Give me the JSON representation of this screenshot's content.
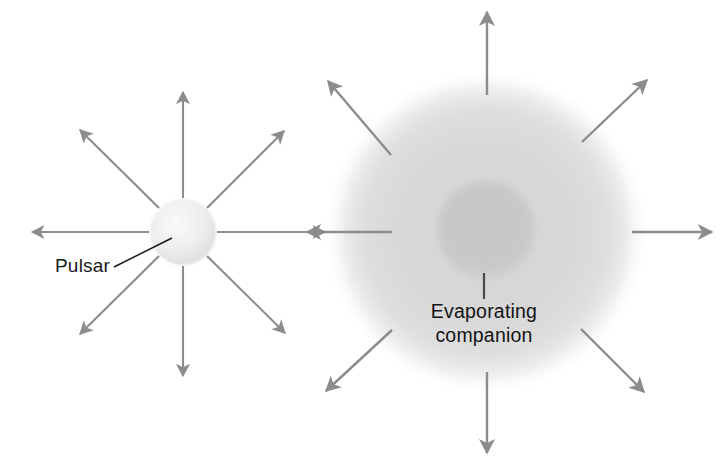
{
  "figure": {
    "background_color": "#ffffff"
  },
  "labels": {
    "pulsar": {
      "text": "Pulsar",
      "x": 55,
      "y": 272
    },
    "companion_line1": {
      "text": "Evaporating",
      "x": 484,
      "y": 318
    },
    "companion_line2": {
      "text": "companion",
      "x": 484,
      "y": 342
    }
  },
  "objects": {
    "pulsar_sphere": {
      "name": "Pulsar",
      "cx": 183,
      "cy": 232,
      "r": 33,
      "fill_light": "#f2f2f2",
      "fill_dark": "#d8d8d8"
    },
    "wind_cloud": {
      "name": "Evaporated gas cloud",
      "cx": 486,
      "cy": 232,
      "r": 156,
      "fill": "#d9d9d9"
    },
    "companion_core": {
      "name": "Evaporating companion",
      "cx": 486,
      "cy": 230,
      "r": 49,
      "fill": "#c9c9c9"
    }
  },
  "colors": {
    "arrow_stroke": "#8c8c8c",
    "leader_stroke": "#1a1a1a",
    "companion_leader_stroke": "#4a4a4a",
    "text": "#1a1a1a",
    "cloud": "#d9d9d9",
    "core": "#c9c9c9",
    "sphere": "#ededed"
  },
  "pulsar_arrows": {
    "count": 8,
    "description": "Eight arrows radiating outward from the pulsar",
    "items": [
      {
        "dir": "north",
        "x1": 183,
        "y1": 198,
        "x2": 183,
        "y2": 92
      },
      {
        "dir": "northeast",
        "x1": 207,
        "y1": 208,
        "x2": 284,
        "y2": 131
      },
      {
        "dir": "east",
        "x1": 217,
        "y1": 232,
        "x2": 325,
        "y2": 232
      },
      {
        "dir": "southeast",
        "x1": 207,
        "y1": 256,
        "x2": 285,
        "y2": 333
      },
      {
        "dir": "south",
        "x1": 183,
        "y1": 266,
        "x2": 183,
        "y2": 376
      },
      {
        "dir": "southwest",
        "x1": 159,
        "y1": 256,
        "x2": 80,
        "y2": 334
      },
      {
        "dir": "west",
        "x1": 149,
        "y1": 232,
        "x2": 32,
        "y2": 232
      },
      {
        "dir": "northwest",
        "x1": 159,
        "y1": 208,
        "x2": 80,
        "y2": 130
      }
    ]
  },
  "cloud_arrows": {
    "count": 8,
    "description": "Eight arrows radiating outward from the gas cloud edge",
    "items": [
      {
        "dir": "north",
        "x1": 487,
        "y1": 95,
        "x2": 487,
        "y2": 12
      },
      {
        "dir": "northeast",
        "x1": 582,
        "y1": 142,
        "x2": 647,
        "y2": 80
      },
      {
        "dir": "east",
        "x1": 632,
        "y1": 232,
        "x2": 712,
        "y2": 232
      },
      {
        "dir": "southeast",
        "x1": 581,
        "y1": 329,
        "x2": 644,
        "y2": 392
      },
      {
        "dir": "south",
        "x1": 487,
        "y1": 372,
        "x2": 487,
        "y2": 453
      },
      {
        "dir": "southwest",
        "x1": 392,
        "y1": 330,
        "x2": 326,
        "y2": 391
      },
      {
        "dir": "west",
        "x1": 392,
        "y1": 232,
        "x2": 307,
        "y2": 232
      },
      {
        "dir": "northwest",
        "x1": 391,
        "y1": 155,
        "x2": 328,
        "y2": 81
      }
    ]
  },
  "leaders": {
    "pulsar_leader": {
      "x1": 114,
      "y1": 267,
      "x2": 172,
      "y2": 238
    },
    "companion_leader": {
      "x1": 484,
      "y1": 273,
      "x2": 484,
      "y2": 299
    }
  }
}
